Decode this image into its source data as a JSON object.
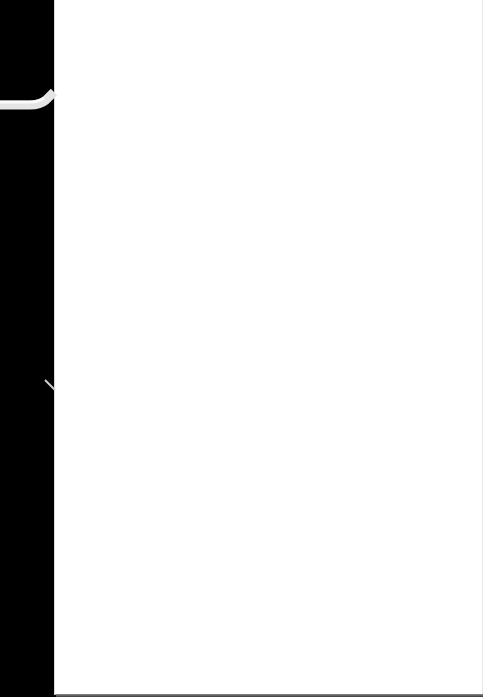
{
  "scene": {
    "description": "Blank white sheet of paper on a black background with a white cable entering from the left edge",
    "background_color": "#000000",
    "paper_color": "#ffffff",
    "cable_color": "#e8e8e8",
    "text": ""
  }
}
